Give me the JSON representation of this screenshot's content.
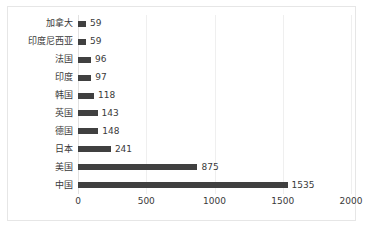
{
  "chart_data": {
    "type": "bar",
    "orientation": "horizontal",
    "title": "",
    "subtitle": "",
    "xlabel": "",
    "ylabel": "",
    "xlim": [
      0,
      2000
    ],
    "xticks": [
      0,
      500,
      1000,
      1500,
      2000
    ],
    "xtick_labels": [
      "0",
      "500",
      "1000",
      "1500",
      "2000"
    ],
    "grid": "vertical",
    "legend": "none",
    "bar_color": "#404040",
    "gridline_color": "#efefef",
    "border_color": "#e6e6e6",
    "background": "#ffffff",
    "categories": [
      "加拿大",
      "印度尼西亚",
      "法国",
      "印度",
      "韩国",
      "英国",
      "德国",
      "日本",
      "美国",
      "中国"
    ],
    "values": [
      59,
      59,
      96,
      97,
      118,
      143,
      148,
      241,
      875,
      1535
    ],
    "data_labels": [
      "59",
      "59",
      "96",
      "97",
      "118",
      "143",
      "148",
      "241",
      "875",
      "1535"
    ],
    "series": [
      {
        "name": "",
        "values": [
          59,
          59,
          96,
          97,
          118,
          143,
          148,
          241,
          875,
          1535
        ]
      }
    ],
    "rows": [
      {
        "label": "加拿大",
        "value": 59,
        "value_text": "59"
      },
      {
        "label": "印度尼西亚",
        "value": 59,
        "value_text": "59"
      },
      {
        "label": "法国",
        "value": 96,
        "value_text": "96"
      },
      {
        "label": "印度",
        "value": 97,
        "value_text": "97"
      },
      {
        "label": "韩国",
        "value": 118,
        "value_text": "118"
      },
      {
        "label": "英国",
        "value": 143,
        "value_text": "143"
      },
      {
        "label": "德国",
        "value": 148,
        "value_text": "148"
      },
      {
        "label": "日本",
        "value": 241,
        "value_text": "241"
      },
      {
        "label": "美国",
        "value": 875,
        "value_text": "875"
      },
      {
        "label": "中国",
        "value": 1535,
        "value_text": "1535"
      }
    ]
  }
}
